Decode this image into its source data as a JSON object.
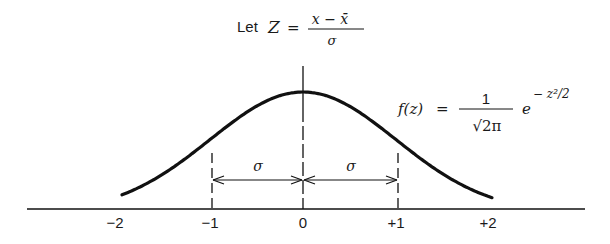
{
  "title_formula": {
    "prefix": "Let",
    "variable": "Z",
    "equals": "=",
    "numerator": "x − x̄",
    "denominator": "σ"
  },
  "density_formula": {
    "lhs": "f(z)",
    "equals": "=",
    "numerator": "1",
    "denominator": "√2π",
    "base": "e",
    "exponent": "− z²/2"
  },
  "axis": {
    "ticks": [
      {
        "label": "−2",
        "value": -2
      },
      {
        "label": "−1",
        "value": -1
      },
      {
        "label": "0",
        "value": 0
      },
      {
        "label": "+1",
        "value": 1
      },
      {
        "label": "+2",
        "value": 2
      }
    ]
  },
  "annotations": {
    "left_sigma": "σ",
    "right_sigma": "σ"
  },
  "colors": {
    "ink": "#111111",
    "background": "#ffffff"
  }
}
